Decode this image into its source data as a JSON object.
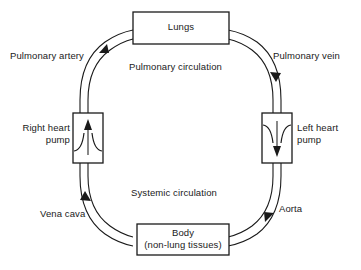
{
  "diagram": {
    "boxes": {
      "lungs": {
        "label": "Lungs"
      },
      "body": {
        "line1": "Body",
        "line2": "(non-lung tissues)"
      },
      "right_heart": {
        "line1": "Right heart",
        "line2": "pump"
      },
      "left_heart": {
        "line1": "Left heart",
        "line2": "pump"
      }
    },
    "vessel_labels": {
      "pulmonary_artery": "Pulmonary artery",
      "pulmonary_vein": "Pulmonary vein",
      "vena_cava": "Vena cava",
      "aorta": "Aorta"
    },
    "circuit_labels": {
      "pulmonary": "Pulmonary circulation",
      "systemic": "Systemic circulation"
    },
    "colors": {
      "stroke": "#1a1a1a",
      "background": "#ffffff",
      "pump_arrow": "#3a3a3a"
    }
  }
}
